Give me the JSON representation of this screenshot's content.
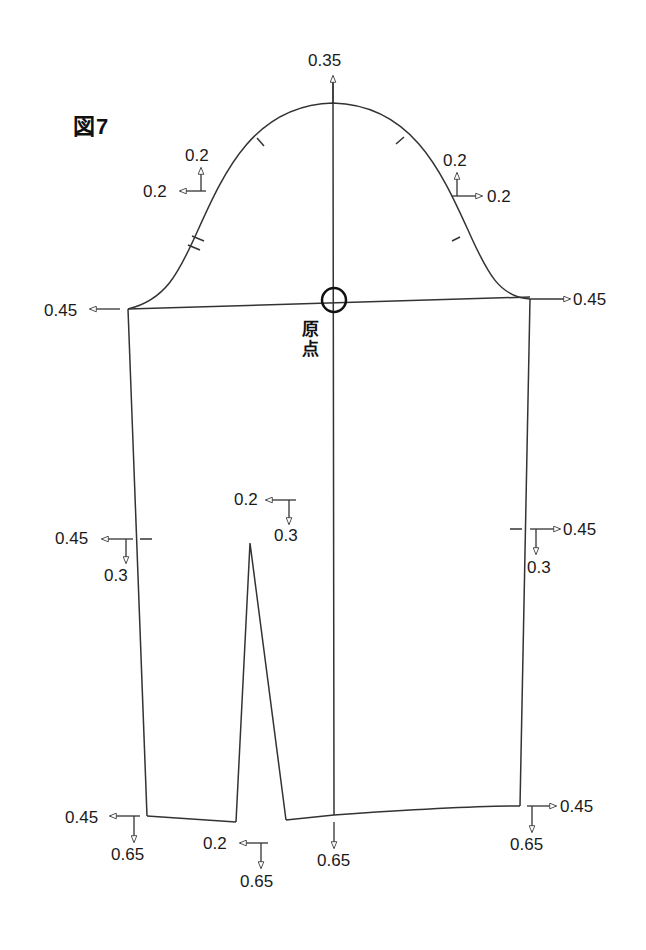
{
  "figure": {
    "title": "図7",
    "origin_label_line1": "原",
    "origin_label_line2": "点"
  },
  "colors": {
    "line": "#333333",
    "text": "#1a1a1a",
    "background": "#ffffff"
  },
  "grading_labels": {
    "cap_top": {
      "up": "0.35"
    },
    "cap_left": {
      "up": "0.2",
      "left": "0.2"
    },
    "cap_right": {
      "up": "0.2",
      "right": "0.2"
    },
    "underarm_left": {
      "left": "0.45"
    },
    "underarm_right": {
      "right": "0.45"
    },
    "elbow_left": {
      "left": "0.45",
      "down": "0.3"
    },
    "elbow_right": {
      "right": "0.45",
      "down": "0.3"
    },
    "dart_top": {
      "left": "0.2",
      "down": "0.3"
    },
    "hem_left": {
      "left": "0.45",
      "down": "0.65"
    },
    "hem_dart": {
      "left": "0.2",
      "down": "0.65"
    },
    "hem_center": {
      "down": "0.65"
    },
    "hem_right": {
      "right": "0.45",
      "down": "0.65"
    }
  }
}
